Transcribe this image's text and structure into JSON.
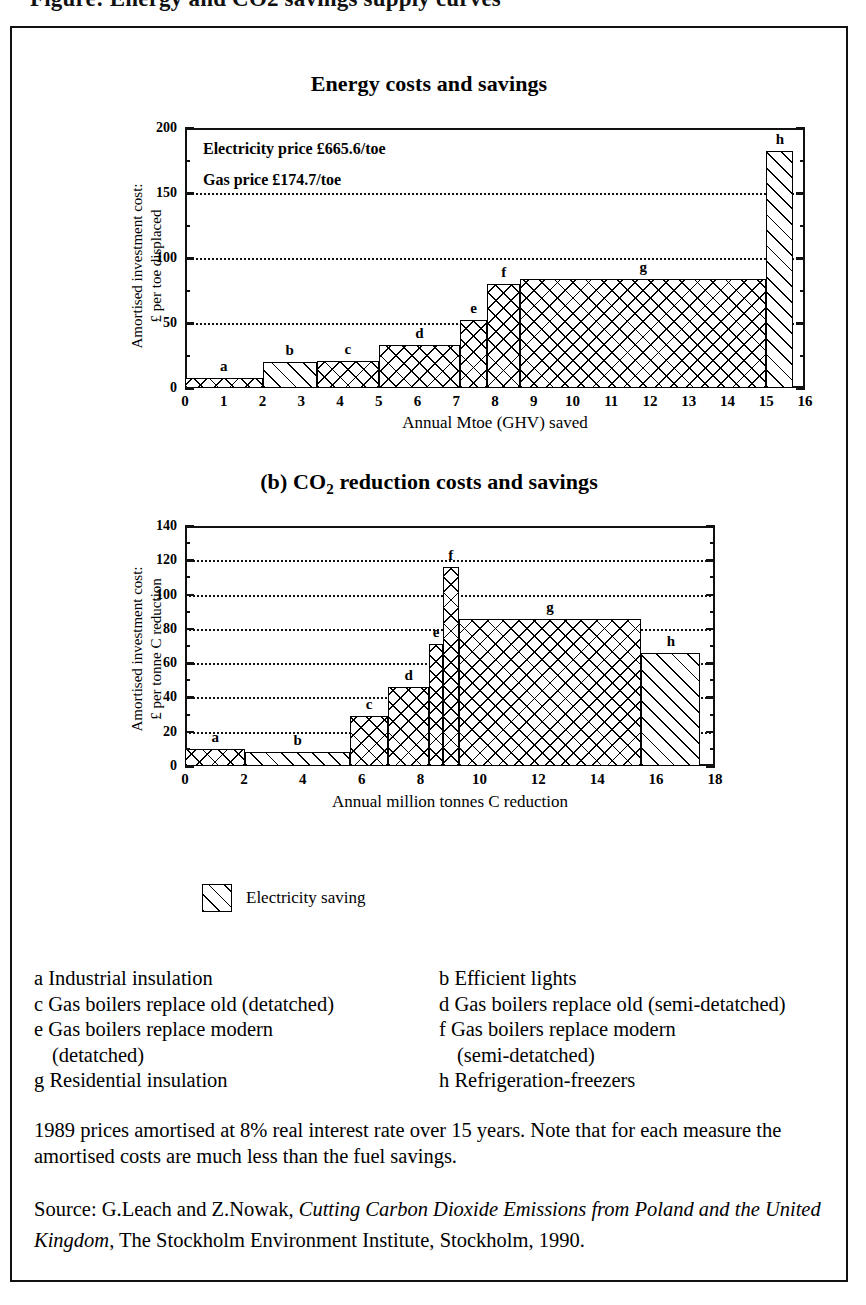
{
  "top_cut_text": "Figure: Energy and CO2 savings supply curves",
  "charts": {
    "a": {
      "title_prefix": "(a)",
      "title": "(a) Energy costs and savings",
      "title_main": "Energy costs and savings",
      "ylabel": "Amortised investment cost:",
      "ylabel2": "£ per toe displaced",
      "xlabel": "Annual Mtoe (GHV) saved",
      "notes": [
        "Electricity price £665.6/toe",
        "Gas price £174.7/toe"
      ],
      "yticks": [
        "0",
        "50",
        "100",
        "150",
        "200"
      ],
      "xticks": [
        "0",
        "1",
        "2",
        "3",
        "4",
        "5",
        "6",
        "7",
        "8",
        "9",
        "10",
        "11",
        "12",
        "13",
        "14",
        "15",
        "16"
      ]
    },
    "b": {
      "title_pre": "(b) CO",
      "title_sub": "2",
      "title_post": " reduction costs and savings",
      "ylabel": "Amortised investment cost:",
      "ylabel2": "£ per tonne C reduction",
      "xlabel": "Annual million tonnes C reduction",
      "yticks": [
        "0",
        "20",
        "40",
        "60",
        "80",
        "100",
        "120",
        "140"
      ],
      "xticks": [
        "0",
        "2",
        "4",
        "6",
        "8",
        "10",
        "12",
        "14",
        "16",
        "18"
      ]
    }
  },
  "legend": {
    "swatch_name": "diagonal-hatch",
    "label": "Electricity saving"
  },
  "key_items": [
    {
      "letter": "a",
      "text": "a Industrial insulation"
    },
    {
      "letter": "b",
      "text": "b Efficient lights"
    },
    {
      "letter": "c",
      "text": "c Gas boilers replace old (detatched)"
    },
    {
      "letter": "d",
      "text": "d Gas boilers replace old (semi-detatched)"
    },
    {
      "letter": "e",
      "text": "e Gas boilers replace modern"
    },
    {
      "letter": "f",
      "text": "f Gas boilers replace modern"
    },
    {
      "letter": "e2",
      "text": "(detatched)"
    },
    {
      "letter": "f2",
      "text": "(semi-detatched)"
    },
    {
      "letter": "g",
      "text": "g Residential insulation"
    },
    {
      "letter": "h",
      "text": "h Refrigeration-freezers"
    }
  ],
  "note_paragraph": "1989 prices amortised at 8% real interest rate over 15 years. Note that for each measure the amortised costs are much less than the fuel savings.",
  "source": {
    "prefix": "Source: G.Leach and Z.Nowak, ",
    "italic1": "Cutting Carbon Dioxide Emissions from",
    "italic2": "Poland and the United Kingdom",
    "suffix": ", The Stockholm Environment Institute,",
    "tail": "Stockholm, 1990."
  },
  "chart_data": [
    {
      "id": "a",
      "type": "bar",
      "title": "(a) Energy costs and savings",
      "xlabel": "Annual Mtoe (GHV) saved",
      "ylabel": "Amortised investment cost: £ per toe displaced",
      "xlim": [
        0,
        16
      ],
      "ylim": [
        0,
        200
      ],
      "xticks": [
        0,
        1,
        2,
        3,
        4,
        5,
        6,
        7,
        8,
        9,
        10,
        11,
        12,
        13,
        14,
        15,
        16
      ],
      "yticks": [
        0,
        50,
        100,
        150,
        200
      ],
      "gridlines_y": [
        50,
        100,
        150
      ],
      "grid": "dotted-horizontal",
      "annotations": [
        "Electricity price £665.6/toe",
        "Gas price £174.7/toe"
      ],
      "bars": [
        {
          "label": "a",
          "x0": 0.0,
          "x1": 2.0,
          "value": 8,
          "fill": "cross"
        },
        {
          "label": "b",
          "x0": 2.0,
          "x1": 3.4,
          "value": 20,
          "fill": "diagonal"
        },
        {
          "label": "c",
          "x0": 3.4,
          "x1": 5.0,
          "value": 21,
          "fill": "cross"
        },
        {
          "label": "d",
          "x0": 5.0,
          "x1": 7.1,
          "value": 33,
          "fill": "cross"
        },
        {
          "label": "e",
          "x0": 7.1,
          "x1": 7.8,
          "value": 52,
          "fill": "cross"
        },
        {
          "label": "f",
          "x0": 7.8,
          "x1": 8.65,
          "value": 80,
          "fill": "cross"
        },
        {
          "label": "g",
          "x0": 8.65,
          "x1": 15.0,
          "value": 84,
          "fill": "cross"
        },
        {
          "label": "h",
          "x0": 15.0,
          "x1": 15.7,
          "value": 182,
          "fill": "diagonal"
        }
      ]
    },
    {
      "id": "b",
      "type": "bar",
      "title": "(b) CO2 reduction costs and savings",
      "xlabel": "Annual million tonnes C reduction",
      "ylabel": "Amortised investment cost: £ per tonne C reduction",
      "xlim": [
        0,
        18
      ],
      "ylim": [
        0,
        140
      ],
      "xticks": [
        0,
        2,
        4,
        6,
        8,
        10,
        12,
        14,
        16,
        18
      ],
      "yticks": [
        0,
        20,
        40,
        60,
        80,
        100,
        120,
        140
      ],
      "gridlines_y": [
        20,
        40,
        60,
        80,
        100,
        120
      ],
      "grid": "dotted-horizontal",
      "bars": [
        {
          "label": "a",
          "x0": 0.0,
          "x1": 2.05,
          "value": 10,
          "fill": "cross"
        },
        {
          "label": "b",
          "x0": 2.05,
          "x1": 5.6,
          "value": 8,
          "fill": "diagonal"
        },
        {
          "label": "c",
          "x0": 5.6,
          "x1": 6.9,
          "value": 29,
          "fill": "cross"
        },
        {
          "label": "d",
          "x0": 6.9,
          "x1": 8.3,
          "value": 46,
          "fill": "cross"
        },
        {
          "label": "e",
          "x0": 8.3,
          "x1": 8.75,
          "value": 71,
          "fill": "cross"
        },
        {
          "label": "f",
          "x0": 8.75,
          "x1": 9.3,
          "value": 116,
          "fill": "cross"
        },
        {
          "label": "g",
          "x0": 9.3,
          "x1": 15.5,
          "value": 86,
          "fill": "cross"
        },
        {
          "label": "h",
          "x0": 15.5,
          "x1": 17.5,
          "value": 66,
          "fill": "diagonal"
        }
      ]
    }
  ]
}
